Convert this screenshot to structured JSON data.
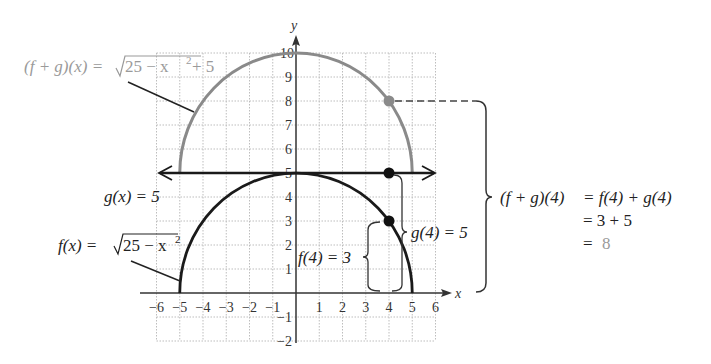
{
  "figure": {
    "axis_labels": {
      "x": "x",
      "y": "y"
    },
    "x_ticks": [
      "−6",
      "−5",
      "−4",
      "−3",
      "−2",
      "−1",
      "1",
      "2",
      "3",
      "4",
      "5",
      "6"
    ],
    "x_tick_values": [
      -6,
      -5,
      -4,
      -3,
      -2,
      -1,
      1,
      2,
      3,
      4,
      5,
      6
    ],
    "y_ticks": [
      "10",
      "9",
      "8",
      "7",
      "6",
      "5",
      "4",
      "3",
      "2",
      "1",
      "−1",
      "−2"
    ],
    "y_tick_values": [
      10,
      9,
      8,
      7,
      6,
      5,
      4,
      3,
      2,
      1,
      -1,
      -2
    ],
    "colors": {
      "sum_curve": "#8a8a8a",
      "sum_label": "#9a9a9a",
      "black": "#1a1a1a",
      "grid": "#bdbdbd"
    },
    "labels": {
      "sum_fn_lhs": "(f + g)(x) = ",
      "sum_fn_rad": "25 − x",
      "sum_fn_exp": "2",
      "sum_fn_tail": " + 5",
      "g_fn": "g(x) = 5",
      "f_fn_lhs": "f(x) = ",
      "f_fn_rad": "25 − x",
      "f_fn_exp": "2",
      "f4": "f(4) = 3",
      "g4": "g(4) = 5",
      "eq_line1_lhs": "(f + g)(4)",
      "eq_line1_rhs": "= f(4) + g(4)",
      "eq_line2": "= 3 + 5",
      "eq_line3_eq": "=",
      "eq_line3_val": "8"
    },
    "points": [
      {
        "name": "sum-point",
        "x": 4,
        "y": 8
      },
      {
        "name": "g-point",
        "x": 4,
        "y": 5
      },
      {
        "name": "f-point",
        "x": 4,
        "y": 3
      }
    ]
  }
}
